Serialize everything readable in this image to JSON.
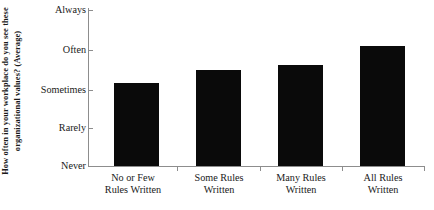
{
  "chart_data": {
    "type": "bar",
    "title": "",
    "subtitle": "",
    "xlabel": "",
    "ylabel": "How often in your workplace do you see these organizational values? (Average)",
    "categories": [
      "No or Few Rules Written",
      "Some Rules Written",
      "Many Rules Written",
      "All Rules Written"
    ],
    "category_lines": [
      [
        "No or Few",
        "Rules Written"
      ],
      [
        "Some Rules",
        "Written"
      ],
      [
        "Many Rules",
        "Written"
      ],
      [
        "All Rules",
        "Written"
      ]
    ],
    "values": [
      3.13,
      3.46,
      3.59,
      4.08
    ],
    "ytick_labels": [
      "Never",
      "Rarely",
      "Sometimes",
      "Often",
      "Always"
    ],
    "ytick_values": [
      1,
      2,
      3,
      4,
      5
    ],
    "ylim": [
      1,
      5
    ],
    "grid": false,
    "legend": false,
    "legend_position": "none",
    "bar_color": "#0a0a0a",
    "axis_color": "#8d8d8d",
    "background_color": "#ffffff"
  },
  "axis": {
    "tick_always": "Always",
    "tick_often": "Often",
    "tick_sometimes": "Sometimes",
    "tick_rarely": "Rarely",
    "tick_never": "Never"
  },
  "categories_display": {
    "c0_line1": "No or Few",
    "c0_line2": "Rules Written",
    "c1_line1": "Some Rules",
    "c1_line2": "Written",
    "c2_line1": "Many Rules",
    "c2_line2": "Written",
    "c3_line1": "All Rules",
    "c3_line2": "Written"
  }
}
